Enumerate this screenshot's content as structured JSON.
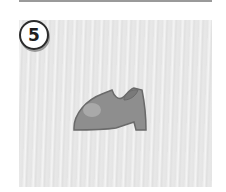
{
  "item": {
    "number": "5",
    "illustration": "shoe-icon"
  },
  "colors": {
    "panel": "#e8e8e8",
    "shoe": "#8e8e8e",
    "shoe_outline": "#6a6a6a",
    "shoe_highlight": "#b0b0b0",
    "badge_border": "#2b2b2b"
  }
}
